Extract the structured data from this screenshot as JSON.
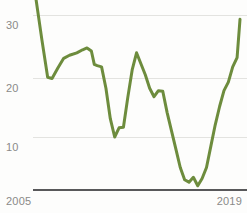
{
  "chart_data": {
    "type": "line",
    "title": "",
    "subtitle": "",
    "xlabel": "",
    "ylabel": "",
    "xlim": [
      2005,
      2019
    ],
    "ylim": [
      0,
      33
    ],
    "grid": true,
    "grid_axis": "y",
    "legend": false,
    "legend_position": "none",
    "y_ticks": [
      10,
      20,
      30
    ],
    "y_tick_labels": [
      "10",
      "20",
      "30"
    ],
    "x_ticks": [
      2005,
      2019
    ],
    "x_tick_labels": [
      "2005",
      "2019"
    ],
    "series": [
      {
        "name": "value",
        "color": "#6d8c3d",
        "x": [
          2005.0,
          2005.4,
          2005.8,
          2006.1,
          2006.5,
          2006.9,
          2007.3,
          2007.8,
          2008.2,
          2008.5,
          2008.8,
          2009.0,
          2009.2,
          2009.5,
          2009.8,
          2010.1,
          2010.4,
          2010.7,
          2011.0,
          2011.3,
          2011.6,
          2011.9,
          2012.2,
          2012.5,
          2012.8,
          2013.1,
          2013.4,
          2013.7,
          2014.0,
          2014.3,
          2014.6,
          2014.9,
          2015.2,
          2015.5,
          2015.8,
          2016.1,
          2016.4,
          2016.7,
          2017.0,
          2017.3,
          2017.6,
          2017.9,
          2018.2,
          2018.5,
          2018.8,
          2019.0
        ],
        "values": [
          32.6,
          26.0,
          19.8,
          19.6,
          21.3,
          22.9,
          23.4,
          23.8,
          24.3,
          24.6,
          24.1,
          21.9,
          21.7,
          21.5,
          18.0,
          13.0,
          10.0,
          11.5,
          11.6,
          16.5,
          21.0,
          23.8,
          22.0,
          20.2,
          18.0,
          16.6,
          17.6,
          17.5,
          14.0,
          11.0,
          8.0,
          5.0,
          3.0,
          2.6,
          3.4,
          2.0,
          3.2,
          5.0,
          8.5,
          12.0,
          15.0,
          17.6,
          19.0,
          21.5,
          23.0,
          29.3
        ]
      }
    ]
  }
}
